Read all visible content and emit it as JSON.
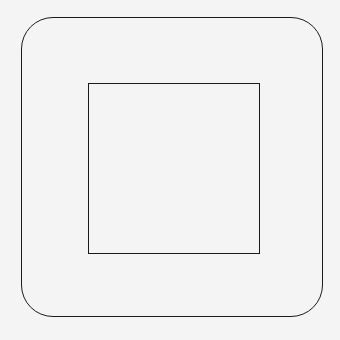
{
  "diagram": {
    "shapes": [
      {
        "type": "rounded-rectangle",
        "role": "outer",
        "stroke": "#1a1a1a",
        "fill": "none"
      },
      {
        "type": "rectangle",
        "role": "inner",
        "stroke": "#1a1a1a",
        "fill": "none"
      }
    ],
    "background": "#f4f4f4"
  }
}
